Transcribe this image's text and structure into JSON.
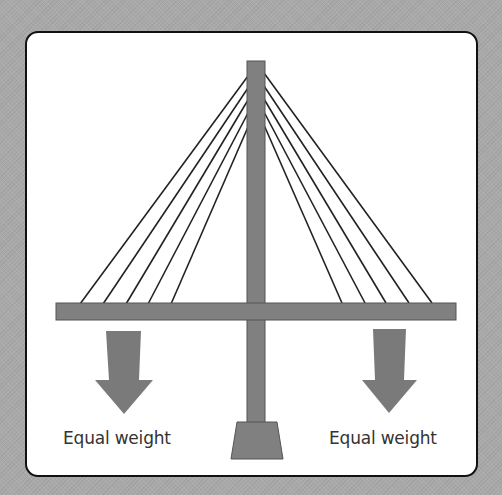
{
  "diagram": {
    "type": "cable-stayed bridge load diagram",
    "colors": {
      "background": "#a9a9a9",
      "card": "#ffffff",
      "border": "#111111",
      "structure": "#808080",
      "cable": "#222222",
      "text": "#333333"
    },
    "labels": {
      "left_load": "Equal weight",
      "right_load": "Equal weight"
    },
    "elements": [
      "tower",
      "deck",
      "left-cables",
      "right-cables",
      "left-load-arrow",
      "right-load-arrow",
      "tower-footing"
    ]
  }
}
